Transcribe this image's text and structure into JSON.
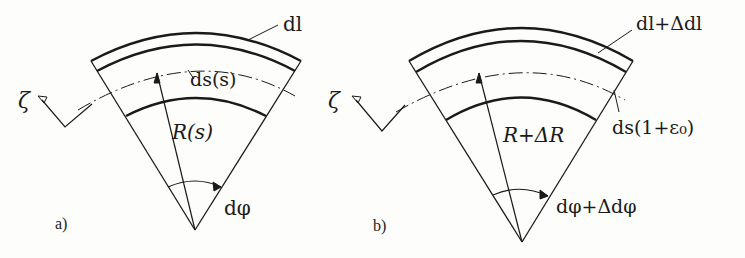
{
  "figure": {
    "panel_a": {
      "tag": "a)",
      "zeta": "ζ",
      "dl": "dl",
      "ds": "ds(s)",
      "radius": "R(s)",
      "angle": "dφ"
    },
    "panel_b": {
      "tag": "b)",
      "zeta": "ζ",
      "dl": "dl+Δdl",
      "ds": "ds(1+ε₀)",
      "radius": "R+ΔR",
      "angle": "dφ+Δdφ"
    }
  },
  "colors": {
    "ink": "#1a1a1a",
    "background": "#fdfdfb"
  }
}
